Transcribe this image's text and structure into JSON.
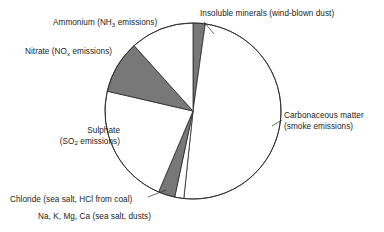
{
  "chart_data": {
    "type": "pie",
    "title": "",
    "subtitle": "",
    "xlabel": "",
    "ylabel": "",
    "legend_position": "callout-labels",
    "grid": false,
    "start_angle_deg": 0,
    "direction": "clockwise",
    "center": {
      "x": 193,
      "y": 111
    },
    "radius": 88,
    "colors": {
      "fill_light": "#ffffff",
      "fill_dark": "#787878",
      "stroke": "#2b2b2b"
    },
    "categories": [
      "Insoluble minerals (wind-blown dust)",
      "Carbonaceous matter (smoke emissions)",
      "Na, K, Mg, Ca (sea salt, dusts)",
      "Chloride (sea salt, HCl from coal)",
      "Sulphate (SO2 emissions)",
      "Nitrate (NOx emissions)",
      "Ammonium (NH3 emissions)"
    ],
    "values": [
      2.2,
      49.4,
      1.7,
      3.1,
      22.2,
      9.7,
      11.7
    ],
    "slices": [
      {
        "name": "Insoluble minerals (wind-blown dust)",
        "start_deg": 0,
        "end_deg": 8,
        "percent": 2.2,
        "shade": "dark"
      },
      {
        "name": "Carbonaceous matter (smoke emissions)",
        "start_deg": 8,
        "end_deg": 186,
        "percent": 49.4,
        "shade": "light"
      },
      {
        "name": "Na, K, Mg, Ca (sea salt, dusts)",
        "start_deg": 186,
        "end_deg": 192,
        "percent": 1.7,
        "shade": "light"
      },
      {
        "name": "Chloride (sea salt, HCl from coal)",
        "start_deg": 192,
        "end_deg": 203,
        "percent": 3.1,
        "shade": "dark"
      },
      {
        "name": "Sulphate (SO2 emissions)",
        "start_deg": 203,
        "end_deg": 283,
        "percent": 22.2,
        "shade": "light"
      },
      {
        "name": "Nitrate (NOx emissions)",
        "start_deg": 283,
        "end_deg": 318,
        "percent": 9.7,
        "shade": "dark"
      },
      {
        "name": "Ammonium (NH3 emissions)",
        "start_deg": 318,
        "end_deg": 360,
        "percent": 11.7,
        "shade": "light"
      }
    ]
  },
  "labels": {
    "insoluble": "Insoluble minerals (wind-blown dust)",
    "ammonium_main": "Ammonium (NH",
    "ammonium_sub": "3",
    "ammonium_tail": " emissions)",
    "nitrate_main": "Nitrate (NO",
    "nitrate_sub": "x",
    "nitrate_tail": " emissions)",
    "sulphate_line1": "Sulphate",
    "sulphate_line2_main": "(SO",
    "sulphate_line2_sub": "2",
    "sulphate_line2_tail": " emissions)",
    "carbonaceous_line1": "Carbonaceous matter",
    "carbonaceous_line2": "(smoke emissions)",
    "chloride": "Chloride (sea salt, HCl from coal)",
    "nakmgca": "Na, K, Mg, Ca (sea salt, dusts)"
  }
}
